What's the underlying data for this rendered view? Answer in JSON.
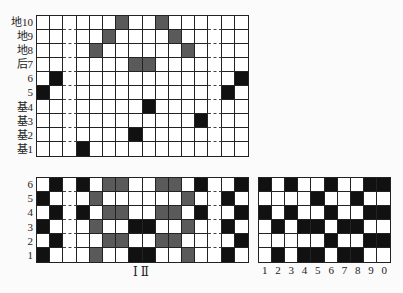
{
  "colors": {
    "black": "#111111",
    "gray": "#5a5a5a",
    "white": "#ffffff",
    "line": "#222222"
  },
  "top_grid": {
    "row_labels": [
      "地10",
      "地9",
      "地8",
      "后7",
      "6",
      "5",
      "基4",
      "基3",
      "基2",
      "基1"
    ],
    "columns": 16,
    "dashed_columns": [
      2,
      13
    ],
    "rows": [
      "WWWWWWGWWGWWWWWW",
      "WWWWWGWWWWGWWWWW",
      "WWWWGWWWWWWGWWWW",
      "WWWWWWWGGWWWWWWW",
      "WBWWWWWWWWWWWWWB",
      "BWWWWWWWWWWWWWBW",
      "WWWWWWWWBWWWWWWW",
      "WWWWWWWWWWWWBWWW",
      "WWWWWWWBWWWWWWWW",
      "WWWBWWWWWWWWWWWW"
    ]
  },
  "bottom_left_grid": {
    "row_labels": [
      "6",
      "5",
      "4",
      "3",
      "2",
      "1"
    ],
    "columns": 16,
    "dashed_columns": [
      2,
      13
    ],
    "rows": [
      "WBWBWGGWWGGWBWWB",
      "BWWWGWWWWWWGWWBW",
      "WBWBWGGWWGGWBWWB",
      "BWWWGWWBBWWGWWBW",
      "WBWWWGGWWGGWWWWB",
      "BWWWGWWBBWWGWWBW"
    ],
    "caption": "Ⅰ Ⅱ"
  },
  "bottom_right_grid": {
    "columns": 10,
    "column_labels": [
      "1",
      "2",
      "3",
      "4",
      "5",
      "6",
      "7",
      "8",
      "9",
      "0"
    ],
    "rows": [
      "BWBWWBWWBB",
      "WWWWBWWBWW",
      "BWBWWBWWBB",
      "WBWBBWBBWW",
      "WWWWWBWWBB",
      "WBWBBWBBWW"
    ]
  }
}
